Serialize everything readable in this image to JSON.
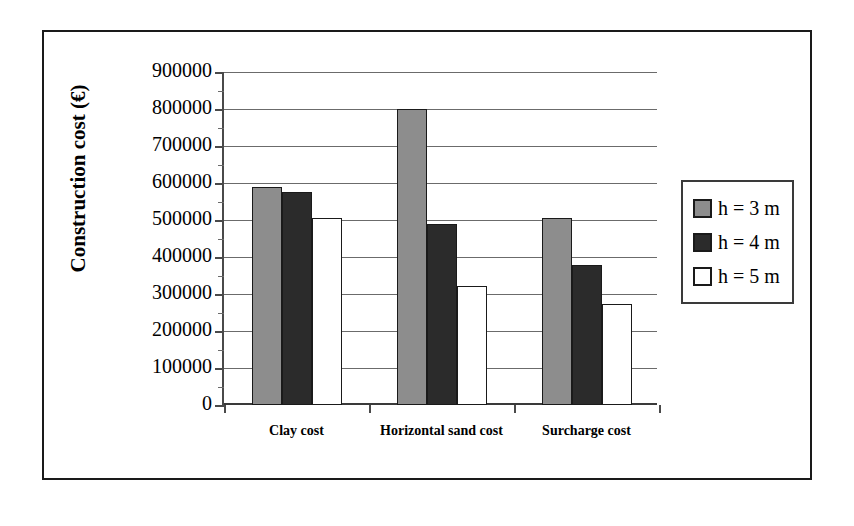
{
  "chart_data": {
    "type": "bar",
    "title": "",
    "xlabel": "",
    "ylabel": "Construction cost (€)",
    "categories": [
      "Clay cost",
      "Horizontal sand cost",
      "Surcharge cost"
    ],
    "series": [
      {
        "name": "h = 3 m",
        "color": "#8d8d8d",
        "values": [
          590000,
          800000,
          505000
        ]
      },
      {
        "name": "h = 4 m",
        "color": "#2b2b2b",
        "values": [
          575000,
          490000,
          378000
        ]
      },
      {
        "name": "h = 5 m",
        "color": "#ffffff",
        "values": [
          505000,
          323000,
          272000
        ]
      }
    ],
    "ylim": [
      0,
      900000
    ],
    "ytick_step": 100000,
    "yticks": [
      0,
      100000,
      200000,
      300000,
      400000,
      500000,
      600000,
      700000,
      800000,
      900000
    ],
    "ytick_labels": [
      "0",
      "100000",
      "200000",
      "300000",
      "400000",
      "500000",
      "600000",
      "700000",
      "800000",
      "900000"
    ],
    "grid": true,
    "grid_axis": "y",
    "legend_position": "right",
    "legend_entries": [
      "h = 3 m",
      "h = 4 m",
      "h = 5 m"
    ],
    "frame": true
  },
  "axis": {
    "y_title": "Construction cost (€)"
  },
  "legend": {
    "items": [
      {
        "label": "h = 3 m"
      },
      {
        "label": "h = 4 m"
      },
      {
        "label": "h = 5 m"
      }
    ]
  }
}
